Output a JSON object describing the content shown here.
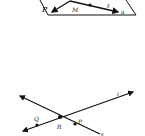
{
  "figures": [
    {
      "id": "plane-figure",
      "plane_label": "P",
      "point_labels": [
        "M"
      ],
      "line_label": "ℓ",
      "corner_mark": "a"
    },
    {
      "id": "intersecting-lines-figure",
      "intersection_label": "R",
      "point_labels": [
        "Q",
        "P"
      ],
      "line_labels": [
        "t",
        "s"
      ]
    }
  ],
  "colors": {
    "ink": "#111111",
    "background": "#ffffff"
  }
}
